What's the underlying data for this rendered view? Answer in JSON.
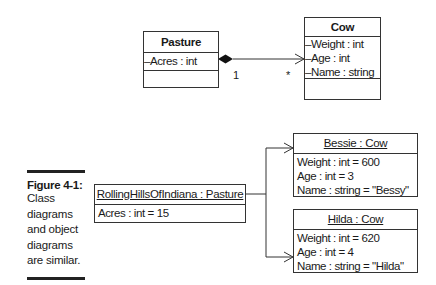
{
  "class_diagram": {
    "pasture": {
      "name": "Pasture",
      "attributes": [
        "–Acres : int"
      ]
    },
    "cow": {
      "name": "Cow",
      "attributes": [
        "–Weight : int",
        "–Age : int",
        "–Name : string"
      ]
    },
    "association": {
      "type": "composition",
      "source_multiplicity": "1",
      "target_multiplicity": "*"
    }
  },
  "object_diagram": {
    "pasture_instance": {
      "name": "RollingHillsOfIndiana : Pasture",
      "attributes": [
        "Acres : int = 15"
      ]
    },
    "cow_instances": [
      {
        "name": "Bessie : Cow",
        "attributes": [
          "Weight : int = 600",
          "Age : int = 3",
          "Name : string = \"Bessy\""
        ]
      },
      {
        "name": "Hilda : Cow",
        "attributes": [
          "Weight : int = 620",
          "Age : int = 4",
          "Name : string = \"Hilda\""
        ]
      }
    ]
  },
  "caption": {
    "title": "Figure 4-1:",
    "lines": [
      "Class",
      "diagrams",
      "and object",
      "diagrams",
      "are similar."
    ]
  }
}
